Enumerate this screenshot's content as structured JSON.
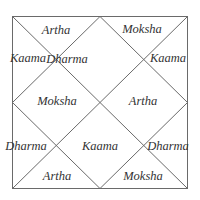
{
  "diagram": {
    "type": "north-indian-chart",
    "line_color": "#6a6a6a",
    "cells": [
      {
        "house": 1,
        "label": "Dharma",
        "x": 67,
        "y": 59
      },
      {
        "house": 2,
        "label": "Artha",
        "x": 56,
        "y": 30
      },
      {
        "house": 3,
        "label": "Kaama",
        "x": 28,
        "y": 58
      },
      {
        "house": 4,
        "label": "Moksha",
        "x": 57,
        "y": 101
      },
      {
        "house": 5,
        "label": "Dharma",
        "x": 26,
        "y": 146
      },
      {
        "house": 6,
        "label": "Artha",
        "x": 57,
        "y": 176
      },
      {
        "house": 7,
        "label": "Kaama",
        "x": 100,
        "y": 146
      },
      {
        "house": 8,
        "label": "Moksha",
        "x": 143,
        "y": 176
      },
      {
        "house": 9,
        "label": "Dharma",
        "x": 168,
        "y": 146
      },
      {
        "house": 10,
        "label": "Artha",
        "x": 143,
        "y": 101
      },
      {
        "house": 11,
        "label": "Kaama",
        "x": 168,
        "y": 58
      },
      {
        "house": 12,
        "label": "Moksha",
        "x": 142,
        "y": 29
      }
    ]
  }
}
